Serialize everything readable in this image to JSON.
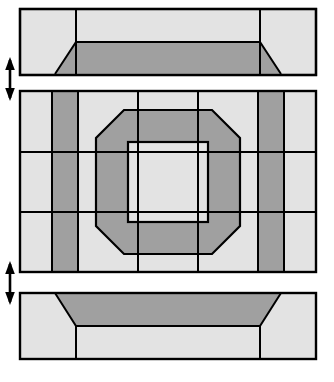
{
  "figure": {
    "type": "technical-cross-section-diagram",
    "width": 334,
    "height": 382,
    "background_color": "#ffffff"
  },
  "colors": {
    "light_gray": "#e3e3e3",
    "dark_gray": "#a0a0a0",
    "outline": "#000000",
    "background": "#ffffff",
    "arrow": "#000000"
  },
  "style": {
    "outer_stroke_width": 2.2,
    "inner_stroke_width": 2.0
  },
  "panels": [
    {
      "id": "top-panel",
      "name": "top-plate",
      "label": "Top plate cross-section",
      "x": 20,
      "y": 9,
      "width": 296,
      "height": 66,
      "fill": "light_gray",
      "features": {
        "chamfered_band": {
          "name": "top-chamfered-band",
          "fill": "dark_gray",
          "band_top_y": 42,
          "band_bottom_y": 75,
          "inner_left_x": 76,
          "inner_right_x": 260,
          "outer_left_x": 55,
          "outer_right_x": 281,
          "description": "Dark trapezoidal band occupying lower portion, chamfered inward at both ends"
        },
        "vertical_rules": [
          {
            "name": "top-rule-left",
            "x": 76
          },
          {
            "name": "top-rule-right",
            "x": 260
          }
        ]
      }
    },
    {
      "id": "middle-panel",
      "name": "core-plate",
      "label": "Core plate cross-section with octagonal aperture",
      "x": 20,
      "y": 91,
      "width": 296,
      "height": 181,
      "fill": "light_gray",
      "features": {
        "vertical_bands": [
          {
            "name": "left-dark-band",
            "fill": "dark_gray",
            "x_start": 52,
            "x_end": 78,
            "description": "Full-height dark vertical band near left edge"
          },
          {
            "name": "right-dark-band",
            "fill": "dark_gray",
            "x_start": 258,
            "x_end": 284,
            "description": "Full-height dark vertical band near right edge"
          }
        ],
        "vertical_rules": [
          {
            "name": "core-rule-1",
            "x": 52
          },
          {
            "name": "core-rule-2",
            "x": 78
          },
          {
            "name": "core-rule-3",
            "x": 138
          },
          {
            "name": "core-rule-4",
            "x": 198
          },
          {
            "name": "core-rule-5",
            "x": 258
          },
          {
            "name": "core-rule-6",
            "x": 284
          }
        ],
        "horizontal_rules": [
          {
            "name": "core-hrule-top",
            "y": 152
          },
          {
            "name": "core-hrule-bottom",
            "y": 212
          }
        ],
        "octagon_ring": {
          "name": "octagonal-aperture-ring",
          "fill": "dark_gray",
          "center_x": 168,
          "center_y": 182,
          "outer_half_width": 72,
          "outer_chamfer": 28,
          "inner_half_width": 40,
          "inner_fill": "light_gray",
          "description": "Dark octagonal ring centered in plate, enclosing a light square core"
        }
      }
    },
    {
      "id": "bottom-panel",
      "name": "bottom-plate",
      "label": "Bottom plate cross-section",
      "x": 20,
      "y": 293,
      "width": 296,
      "height": 66,
      "fill": "light_gray",
      "features": {
        "chamfered_band": {
          "name": "bottom-chamfered-band",
          "fill": "dark_gray",
          "band_top_y": 293,
          "band_bottom_y": 326,
          "inner_left_x": 76,
          "inner_right_x": 260,
          "outer_left_x": 55,
          "outer_right_x": 281,
          "description": "Dark trapezoidal band occupying upper portion, chamfered inward at both ends"
        },
        "vertical_rules": [
          {
            "name": "bottom-rule-left",
            "x": 76
          },
          {
            "name": "bottom-rule-right",
            "x": 260
          }
        ]
      }
    }
  ],
  "gap_indicators": [
    {
      "id": "gap-arrow-upper",
      "name": "upper-gap-arrow",
      "label": "Upper clearance gap",
      "x": 10,
      "y_top": 58,
      "y_bottom": 100,
      "direction": "double-headed-vertical",
      "description": "Double-headed vertical arrow marking clearance between top plate and core plate"
    },
    {
      "id": "gap-arrow-lower",
      "name": "lower-gap-arrow",
      "label": "Lower clearance gap",
      "x": 10,
      "y_top": 262,
      "y_bottom": 304,
      "direction": "double-headed-vertical",
      "description": "Double-headed vertical arrow marking clearance between core plate and bottom plate"
    }
  ]
}
